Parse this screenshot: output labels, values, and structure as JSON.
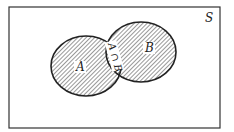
{
  "diagram": {
    "type": "venn",
    "universe_label": "S",
    "sets": [
      {
        "name": "A",
        "label": "A"
      },
      {
        "name": "B",
        "label": "B"
      }
    ],
    "intersection_label": "A ∩ B",
    "shading": "hatched",
    "colors": {
      "stroke": "#222222",
      "background": "#ffffff",
      "hatch": "#333333"
    }
  }
}
